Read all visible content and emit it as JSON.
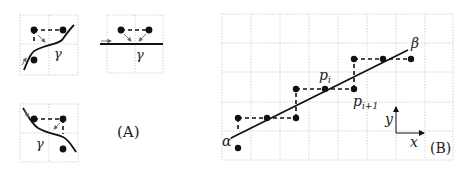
{
  "figure": {
    "panel_a": {
      "label": "(A)",
      "curve_label": "γ"
    },
    "panel_b": {
      "label": "(B)",
      "start_label": "α",
      "end_label": "β",
      "point_i_label": "p",
      "point_i_sub": "i",
      "point_i1_label": "p",
      "point_i1_sub": "i+1",
      "axis_x_label": "x",
      "axis_y_label": "y"
    }
  },
  "colors": {
    "ink": "#111111",
    "grid": "#bdbdbd"
  }
}
